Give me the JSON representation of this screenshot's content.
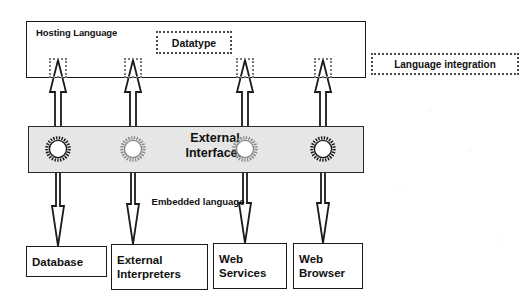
{
  "diagram": {
    "title_text": "Hosting Language",
    "hosting": {
      "label": "Hosting Language",
      "datatype_label": "Datatype",
      "language_integration_label": "Language integration"
    },
    "external_interfaces": {
      "label": "External\nInterfaces",
      "band_color": "#e6e6e6"
    },
    "embedded": {
      "label": "Embedded\nlanguage"
    },
    "leaves": [
      {
        "label": "Database"
      },
      {
        "label": "External\nInterpreters"
      },
      {
        "label": "Web\nServices"
      },
      {
        "label": "Web\nBrowser"
      }
    ],
    "icons": {
      "gear": "gear-icon",
      "arrow_up": "arrow-up-icon",
      "arrow_down": "arrow-down-icon"
    },
    "colors": {
      "stroke": "#1a1a1a",
      "band": "#e6e6e6",
      "dotted": "#4a4a4a",
      "background": "#ffffff"
    }
  }
}
